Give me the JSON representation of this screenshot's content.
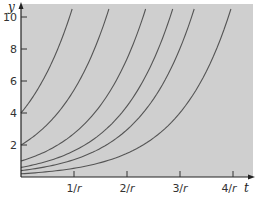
{
  "chart_data": {
    "type": "line",
    "title": "",
    "xlabel": "t",
    "ylabel": "y",
    "x_ticks": [
      "1/r",
      "2/r",
      "3/r",
      "4/r"
    ],
    "y_ticks": [
      "2",
      "4",
      "6",
      "8",
      "10"
    ],
    "xlim": [
      0,
      4.4
    ],
    "ylim": [
      0,
      10.5
    ],
    "grid": false,
    "legend": null,
    "background": "#cfcfcf",
    "curve_color": "#555555",
    "series": [
      {
        "name": "y0 = 4",
        "formula": "y = 4 e^{rt}",
        "y0": 4
      },
      {
        "name": "y0 = 2",
        "formula": "y = 2 e^{rt}",
        "y0": 2
      },
      {
        "name": "y0 = 1",
        "formula": "y = 1 e^{rt}",
        "y0": 1
      },
      {
        "name": "y0 = 0.6",
        "formula": "y = 0.6 e^{rt}",
        "y0": 0.6
      },
      {
        "name": "y0 = 0.4",
        "formula": "y = 0.4 e^{rt}",
        "y0": 0.4
      },
      {
        "name": "y0 = 0.2",
        "formula": "y = 0.2 e^{rt}",
        "y0": 0.2
      }
    ]
  },
  "axes": {
    "x_var": "t",
    "y_var": "y",
    "x_tick_labels": [
      {
        "num": "1/",
        "var": "r"
      },
      {
        "num": "2/",
        "var": "r"
      },
      {
        "num": "3/",
        "var": "r"
      },
      {
        "num": "4/",
        "var": "r"
      }
    ],
    "y_tick_labels": [
      "10",
      "8",
      "6",
      "4",
      "2"
    ]
  }
}
